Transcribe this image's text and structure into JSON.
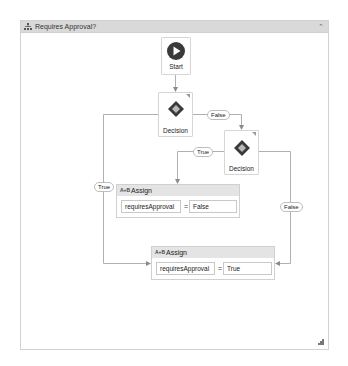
{
  "window": {
    "title": "Requires Approval?",
    "title_icon": "flowchart-icon",
    "collapse_icon": "collapse-up-icon",
    "resize_icon": "resize-grip-icon"
  },
  "nodes": {
    "start": {
      "label": "Start",
      "icon": "play-icon"
    },
    "decision1": {
      "label": "Decision",
      "icon": "diamond-icon"
    },
    "decision2": {
      "label": "Decision",
      "icon": "diamond-icon"
    },
    "assign1": {
      "icon_text": "A+B",
      "title": "Assign",
      "to": "requiresApproval",
      "operator": "=",
      "value": "False"
    },
    "assign2": {
      "icon_text": "A+B",
      "title": "Assign",
      "to": "requiresApproval",
      "operator": "=",
      "value": "True"
    }
  },
  "edges": {
    "d1_false": "False",
    "d1_true": "True",
    "d2_true": "True",
    "d2_false": "False"
  },
  "colors": {
    "line": "#a8a8a8",
    "titlebar": "#d9d9d9",
    "assign_header": "#e4e4e4",
    "start_circle": "#3a3a3a"
  }
}
